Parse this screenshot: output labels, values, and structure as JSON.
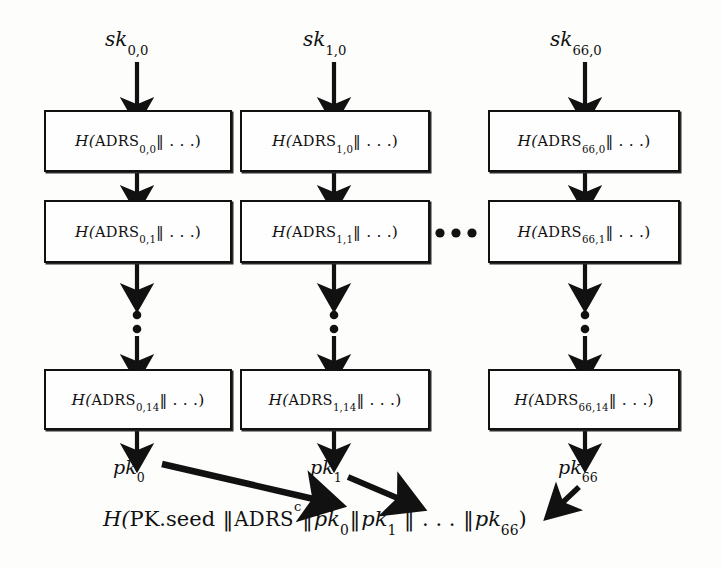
{
  "figure": {
    "type": "wots-chain-diagram",
    "columns": [
      {
        "index": 0,
        "sk_label": {
          "base": "sk",
          "sub": "0,0"
        },
        "pk_label": {
          "base": "pk",
          "sub": "0"
        },
        "nodes": [
          {
            "prefix": "H(",
            "fn": "ADRS",
            "sub": "0,0",
            "suffix": "‖ . . .)"
          },
          {
            "prefix": "H(",
            "fn": "ADRS",
            "sub": "0,1",
            "suffix": "‖ . . .)"
          },
          {
            "prefix": "H(",
            "fn": "ADRS",
            "sub": "0,14",
            "suffix": "‖ . . .)"
          }
        ]
      },
      {
        "index": 1,
        "sk_label": {
          "base": "sk",
          "sub": "1,0"
        },
        "pk_label": {
          "base": "pk",
          "sub": "1"
        },
        "nodes": [
          {
            "prefix": "H(",
            "fn": "ADRS",
            "sub": "1,0",
            "suffix": "‖ . . .)"
          },
          {
            "prefix": "H(",
            "fn": "ADRS",
            "sub": "1,1",
            "suffix": "‖ . . .)"
          },
          {
            "prefix": "H(",
            "fn": "ADRS",
            "sub": "1,14",
            "suffix": "‖ . . .)"
          }
        ]
      },
      {
        "index": 66,
        "sk_label": {
          "base": "sk",
          "sub": "66,0"
        },
        "pk_label": {
          "base": "pk",
          "sub": "66"
        },
        "nodes": [
          {
            "prefix": "H(",
            "fn": "ADRS",
            "sub": "66,0",
            "suffix": "‖ . . .)"
          },
          {
            "prefix": "H(",
            "fn": "ADRS",
            "sub": "66,1",
            "suffix": "‖ . . .)"
          },
          {
            "prefix": "H(",
            "fn": "ADRS",
            "sub": "66,14",
            "suffix": "‖ . . .)"
          }
        ]
      }
    ],
    "horizontal_ellipsis": "• • •",
    "vertical_ellipsis": "⋮",
    "formula": {
      "open": "H(",
      "pk_seed": "PK.seed",
      "sep": "‖",
      "adrs": "ADRS",
      "adrs_sup": "c",
      "terms": [
        {
          "base": "pk",
          "sub": "0"
        },
        {
          "base": "pk",
          "sub": "1"
        },
        {
          "base": "pk",
          "sub": "66"
        }
      ],
      "mid_ellipsis": ". . .",
      "close": ")",
      "plain": "H(PK.seed ‖ ADRSᶜ ‖ pk₀ ‖ pk₁ ‖ . . . ‖ pk₆₆)"
    },
    "colors": {
      "ink": "#111111",
      "paper": "#fdfdfb"
    }
  }
}
